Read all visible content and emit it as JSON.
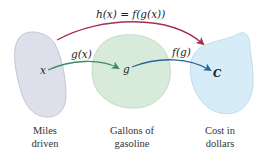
{
  "diagram": {
    "sets": [
      {
        "id": "miles",
        "label_line1": "Miles",
        "label_line2": "driven",
        "element": "x",
        "fill": "#dde0ea",
        "stroke": "#b9bccb"
      },
      {
        "id": "gallons",
        "label_line1": "Gallons of",
        "label_line2": "gasoline",
        "element": "g",
        "fill": "#d8ebda",
        "stroke": "#b9d4bc"
      },
      {
        "id": "cost",
        "label_line1": "Cost in",
        "label_line2": "dollars",
        "element": "C",
        "fill": "#d6ecf6",
        "stroke": "#b4d6e8"
      }
    ],
    "arrows": [
      {
        "id": "g-map",
        "label": "g(x)",
        "color": "#3f8a64"
      },
      {
        "id": "f-map",
        "label": "f(g)",
        "color": "#22679a"
      },
      {
        "id": "h-map",
        "label": "h(x) = f(g(x))",
        "color": "#a4304f"
      }
    ]
  }
}
